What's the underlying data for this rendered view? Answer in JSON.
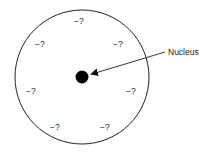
{
  "diagram": {
    "type": "atom-model",
    "atom_circle": {
      "cx": 82,
      "cy": 77,
      "r": 67,
      "stroke": "#222222"
    },
    "nucleus": {
      "cx": 82,
      "cy": 77,
      "r": 6.5,
      "fill": "#000000",
      "label": "Nucleus"
    },
    "arrow": {
      "x1": 165,
      "y1": 52,
      "x2": 91,
      "y2": 74
    },
    "electron_charges": [
      {
        "text": "−?",
        "x": 75,
        "y": 24
      },
      {
        "text": "−?",
        "x": 35,
        "y": 47
      },
      {
        "text": "−?",
        "x": 113,
        "y": 47
      },
      {
        "text": "−?",
        "x": 26,
        "y": 94
      },
      {
        "text": "−?",
        "x": 126,
        "y": 94
      },
      {
        "text": "−?",
        "x": 50,
        "y": 130
      },
      {
        "text": "−?",
        "x": 100,
        "y": 130
      }
    ]
  },
  "labels": {
    "nucleus": "Nucleus",
    "charge_0": "−?",
    "charge_1": "−?",
    "charge_2": "−?",
    "charge_3": "−?",
    "charge_4": "−?",
    "charge_5": "−?",
    "charge_6": "−?"
  }
}
